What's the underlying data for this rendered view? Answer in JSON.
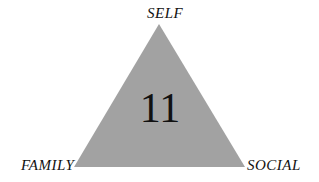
{
  "diagram": {
    "shape": "triangle",
    "fill_color": "#a2a2a2",
    "center_value": "11",
    "vertices": {
      "top": "SELF",
      "bottom_left": "FAMILY",
      "bottom_right": "SOCIAL"
    }
  }
}
